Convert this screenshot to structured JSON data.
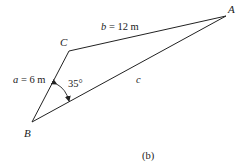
{
  "diagram": {
    "type": "triangle",
    "vertices": [
      {
        "id": "A",
        "label": "A",
        "x": 226,
        "y": 16
      },
      {
        "id": "B",
        "label": "B",
        "x": 32,
        "y": 122
      },
      {
        "id": "C",
        "label": "C",
        "x": 69,
        "y": 51
      }
    ],
    "sides": [
      {
        "id": "a",
        "from": "B",
        "to": "C",
        "var": "a",
        "eq": " = 6 m"
      },
      {
        "id": "b",
        "from": "C",
        "to": "A",
        "var": "b",
        "eq": " = 12 m"
      },
      {
        "id": "c",
        "from": "B",
        "to": "A",
        "var": "c",
        "eq": ""
      }
    ],
    "angle": {
      "at": "B",
      "label": "35°"
    },
    "caption": "(b)",
    "stroke_color": "#222222"
  }
}
